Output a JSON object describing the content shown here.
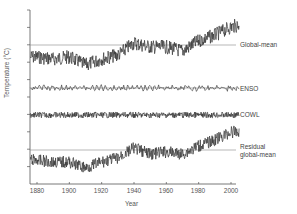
{
  "chart_data": {
    "type": "line",
    "title": "",
    "xlabel": "Year",
    "ylabel": "Temperature (°C)",
    "xlim": [
      1875,
      2008
    ],
    "x_ticks": [
      1880,
      1900,
      1920,
      1940,
      1960,
      1980,
      2000
    ],
    "y_ticks_unlabeled": true,
    "grid": false,
    "legend": "inline labels at right end of each series",
    "series": [
      {
        "name": "Global-mean",
        "baseline": true,
        "description": "Noisy monthly global-mean temperature, below baseline 1880-1930, rising to baseline ~1940, flat to ~1975, then rising strongly above baseline to 2005",
        "x": [
          1880,
          1890,
          1900,
          1910,
          1920,
          1930,
          1940,
          1950,
          1960,
          1970,
          1980,
          1990,
          2000,
          2005
        ],
        "values": [
          -0.3,
          -0.35,
          -0.3,
          -0.5,
          -0.35,
          -0.25,
          0.05,
          -0.05,
          -0.05,
          -0.15,
          0.1,
          0.25,
          0.45,
          0.5
        ]
      },
      {
        "name": "ENSO",
        "baseline": true,
        "description": "Small-amplitude oscillation around baseline",
        "x": [
          1880,
          1900,
          1920,
          1940,
          1960,
          1980,
          2000
        ],
        "values": [
          0,
          0,
          0,
          0,
          0,
          0,
          0
        ]
      },
      {
        "name": "COWL",
        "baseline": true,
        "description": "High-frequency noise around baseline, slightly larger amplitude than ENSO",
        "x": [
          1880,
          1900,
          1920,
          1940,
          1960,
          1980,
          2000
        ],
        "values": [
          0,
          0,
          0,
          0,
          0,
          0,
          0
        ]
      },
      {
        "name": "Residual global-mean",
        "baseline": true,
        "description": "Residual after removing ENSO and COWL; below baseline early, rises ~1940, dips ~1945, then rises strongly after 1980",
        "x": [
          1880,
          1890,
          1900,
          1910,
          1920,
          1930,
          1940,
          1950,
          1960,
          1970,
          1980,
          1990,
          2000,
          2005
        ],
        "values": [
          -0.25,
          -0.3,
          -0.3,
          -0.45,
          -0.3,
          -0.2,
          0.05,
          -0.1,
          -0.05,
          -0.1,
          0.1,
          0.25,
          0.45,
          0.45
        ]
      }
    ]
  },
  "labels": {
    "global_mean": "Global-mean",
    "enso": "ENSO",
    "cowl": "COWL",
    "residual_line1": "Residual",
    "residual_line2": "global-mean",
    "xlabel": "Year",
    "ylabel": "Temperature (°C)"
  },
  "x_ticks": [
    "1880",
    "1900",
    "1920",
    "1940",
    "1960",
    "1980",
    "2000"
  ]
}
